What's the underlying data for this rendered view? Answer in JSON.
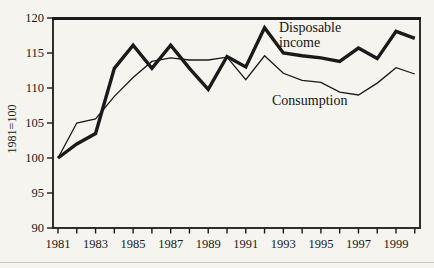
{
  "page": {
    "background": "#f5f4ef",
    "ink_color": "#1a1a1a",
    "bottom_rule_color": "#c9c6bf"
  },
  "annotations": {
    "disposable_line1": "Disposable",
    "disposable_line2": "income",
    "consumption": "Consumption"
  },
  "chart_data": {
    "type": "line",
    "title": "",
    "xlabel": "",
    "ylabel": "1981=100",
    "ylim": [
      90,
      120
    ],
    "yticks": [
      90,
      95,
      100,
      105,
      110,
      115,
      120
    ],
    "x": [
      1981,
      1982,
      1983,
      1984,
      1985,
      1986,
      1987,
      1988,
      1989,
      1990,
      1991,
      1992,
      1993,
      1994,
      1995,
      1996,
      1997,
      1998,
      1999,
      2000
    ],
    "x_labeled_ticks": [
      1981,
      1983,
      1985,
      1987,
      1989,
      1991,
      1993,
      1995,
      1997,
      1999
    ],
    "grid": false,
    "legend_position": "inline-annotations",
    "series": [
      {
        "name": "Disposable income",
        "stroke_width": 3.4,
        "values": [
          100,
          102,
          103.5,
          112.8,
          116.1,
          112.8,
          116.1,
          112.8,
          109.8,
          114.5,
          113.0,
          118.6,
          115.0,
          114.6,
          114.3,
          113.8,
          115.7,
          114.2,
          118.1,
          117.1
        ]
      },
      {
        "name": "Consumption",
        "stroke_width": 1.3,
        "values": [
          100,
          105,
          105.6,
          108.8,
          111.5,
          113.8,
          114.3,
          114.0,
          114.0,
          114.4,
          111.2,
          114.6,
          112.1,
          111.1,
          110.8,
          109.4,
          109.0,
          110.7,
          112.9,
          112.0
        ]
      }
    ]
  }
}
